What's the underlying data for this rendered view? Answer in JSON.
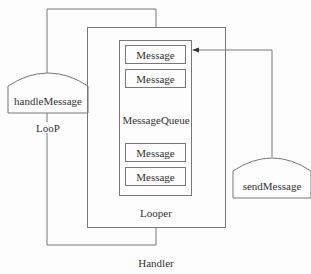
{
  "diagram": {
    "handler_label": "Handler",
    "looper_label": "Looper",
    "queue_label": "MessageQueue",
    "loop_label": "LooP",
    "handle_node": "handleMessage",
    "send_node": "sendMessage",
    "messages": [
      "Message",
      "Message",
      "Message",
      "Message"
    ]
  },
  "colors": {
    "line": "#777777",
    "text": "#333333",
    "background": "#fdfdfd"
  }
}
